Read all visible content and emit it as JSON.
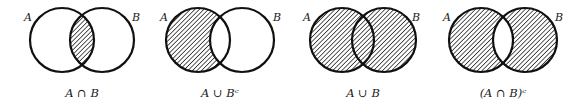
{
  "figure": {
    "colors": {
      "stroke": "#111111",
      "hatch": "#222222",
      "background": "#ffffff"
    },
    "diagrams": [
      {
        "set_a_label": "A",
        "set_b_label": "B",
        "caption": "A ∩ B",
        "shaded": "intersection"
      },
      {
        "set_a_label": "A",
        "set_b_label": "B",
        "caption": "A ∪ Bᶜ",
        "shaded": "A only (A minus B)"
      },
      {
        "set_a_label": "A",
        "set_b_label": "B",
        "caption": "A ∪ B",
        "shaded": "union"
      },
      {
        "set_a_label": "A",
        "set_b_label": "B",
        "caption": "(A ∩ B)ᶜ",
        "shaded": "symmetric difference"
      }
    ]
  }
}
